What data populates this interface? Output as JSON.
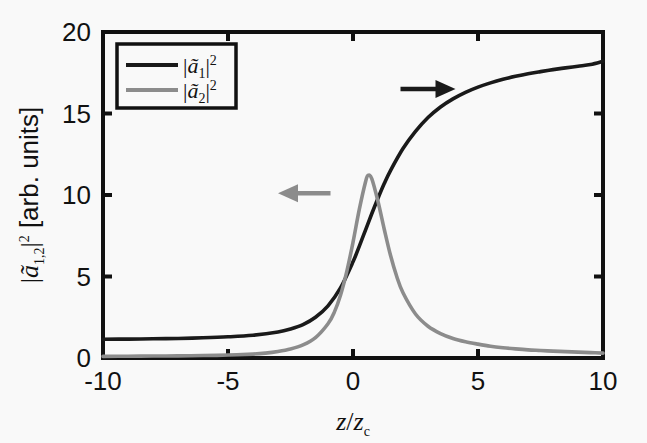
{
  "chart_data": {
    "type": "line",
    "title": "",
    "xlabel": "z/z_c",
    "ylabel": "|a_{1,2}|^2 [arb. units]",
    "xlim": [
      -10,
      10
    ],
    "ylim": [
      0,
      20
    ],
    "xticks": [
      -10,
      -5,
      0,
      5,
      10
    ],
    "xtick_labels": [
      "-10",
      "-5",
      "0",
      "5",
      "10"
    ],
    "yticks": [
      0,
      5,
      10,
      15,
      20
    ],
    "ytick_labels": [
      "0",
      "5",
      "10",
      "15",
      "20"
    ],
    "grid": false,
    "legend_position": "top-left-inside",
    "series": [
      {
        "name": "|a1|^2",
        "color": "#1a1a1a",
        "x": [
          -10,
          -9,
          -8,
          -7,
          -6,
          -5,
          -4,
          -3,
          -2.5,
          -2,
          -1.5,
          -1,
          -0.5,
          0,
          0.25,
          0.5,
          0.75,
          1,
          1.25,
          1.5,
          2,
          2.5,
          3,
          3.5,
          4,
          4.5,
          5,
          5.5,
          6,
          6.5,
          7,
          7.5,
          8,
          8.5,
          9,
          9.5,
          10
        ],
        "values": [
          1.15,
          1.16,
          1.18,
          1.2,
          1.24,
          1.3,
          1.4,
          1.6,
          1.78,
          2.05,
          2.5,
          3.2,
          4.3,
          5.9,
          6.85,
          7.85,
          8.85,
          9.8,
          10.7,
          11.5,
          12.85,
          13.9,
          14.75,
          15.4,
          15.9,
          16.3,
          16.62,
          16.88,
          17.1,
          17.28,
          17.44,
          17.57,
          17.69,
          17.8,
          17.9,
          18.0,
          18.2
        ]
      },
      {
        "name": "|a2|^2",
        "color": "#8c8c8c",
        "x": [
          -10,
          -9,
          -8,
          -7,
          -6,
          -5,
          -4,
          -3.5,
          -3,
          -2.5,
          -2,
          -1.5,
          -1,
          -0.75,
          -0.5,
          -0.25,
          0,
          0.25,
          0.5,
          0.6,
          0.75,
          1,
          1.25,
          1.5,
          1.75,
          2,
          2.5,
          3,
          3.5,
          4,
          4.5,
          5,
          5.5,
          6,
          6.5,
          7,
          7.5,
          8,
          8.5,
          9,
          9.5,
          10
        ],
        "values": [
          0.1,
          0.11,
          0.12,
          0.13,
          0.15,
          0.18,
          0.24,
          0.3,
          0.4,
          0.55,
          0.8,
          1.25,
          2.1,
          2.8,
          3.85,
          5.3,
          7.1,
          9.1,
          10.8,
          11.2,
          11.0,
          9.6,
          7.9,
          6.3,
          5.0,
          4.0,
          2.7,
          1.95,
          1.5,
          1.2,
          1.0,
          0.85,
          0.72,
          0.63,
          0.56,
          0.5,
          0.46,
          0.42,
          0.39,
          0.36,
          0.33,
          0.3
        ]
      }
    ],
    "annotations": [
      {
        "name": "right-arrow",
        "series": "|a1|^2",
        "color": "#1a1a1a",
        "direction": "right",
        "x_from": 1.9,
        "x_to": 4.1,
        "y": 16.5
      },
      {
        "name": "left-arrow",
        "series": "|a2|^2",
        "color": "#8c8c8c",
        "direction": "left",
        "x_from": -0.9,
        "x_to": -3.0,
        "y": 10.1
      }
    ]
  },
  "axes": {
    "ylabel_parts": {
      "bar_open": "|",
      "symbol": "ã",
      "subscript": "1,2",
      "bar_close": "|",
      "superscript": "2",
      "units": " [arb. units]"
    },
    "xlabel_parts": {
      "numerator": "z",
      "slash": "/",
      "denominator": "z",
      "denominator_sub": "c"
    },
    "xtick_labels": [
      "-10",
      "-5",
      "0",
      "5",
      "10"
    ],
    "ytick_labels": [
      "0",
      "5",
      "10",
      "15",
      "20"
    ]
  },
  "legend": {
    "entries": [
      {
        "label_symbol": "ã",
        "label_sub": "1",
        "label_sup": "2",
        "color": "#1a1a1a"
      },
      {
        "label_symbol": "ã",
        "label_sub": "2",
        "label_sup": "2",
        "color": "#8c8c8c"
      }
    ]
  },
  "colors": {
    "series_1": "#1a1a1a",
    "series_2": "#8c8c8c",
    "axis": "#111111",
    "background": "#f9f9f9"
  }
}
